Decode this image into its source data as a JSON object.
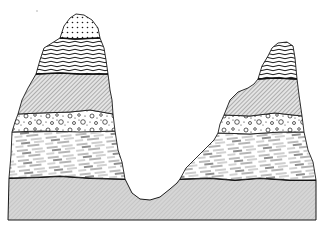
{
  "figure": {
    "type": "geologic-cross-section",
    "description": "Two eroded mesas of horizontally stratified rock separated by a V-shaped valley, resting on a continuous base layer",
    "colors": {
      "ink": "#1a1a1a",
      "base_fill": "#c8c8c8",
      "hatch_fill": "#bdbdbd",
      "background": "#ffffff"
    },
    "layers": [
      {
        "id": "cap",
        "pattern": "dotted",
        "present_in": [
          "left-mesa"
        ]
      },
      {
        "id": "wavy",
        "pattern": "wavy-lines",
        "present_in": [
          "left-mesa",
          "right-mesa"
        ]
      },
      {
        "id": "hatched",
        "pattern": "diagonal-hatch",
        "present_in": [
          "left-mesa",
          "right-mesa"
        ]
      },
      {
        "id": "conglomerate",
        "pattern": "circles-and-dots",
        "present_in": [
          "left-mesa",
          "right-mesa"
        ]
      },
      {
        "id": "streaky",
        "pattern": "dashed-streaks",
        "present_in": [
          "left-mesa",
          "right-mesa"
        ]
      },
      {
        "id": "base",
        "pattern": "fine-stipple",
        "present_in": [
          "continuous"
        ]
      }
    ],
    "features": {
      "left_mesa": "taller peak with dotted cap",
      "right_mesa": "shorter peak, cap eroded away",
      "valley": "V-shaped gorge cut down into the base layer"
    }
  }
}
